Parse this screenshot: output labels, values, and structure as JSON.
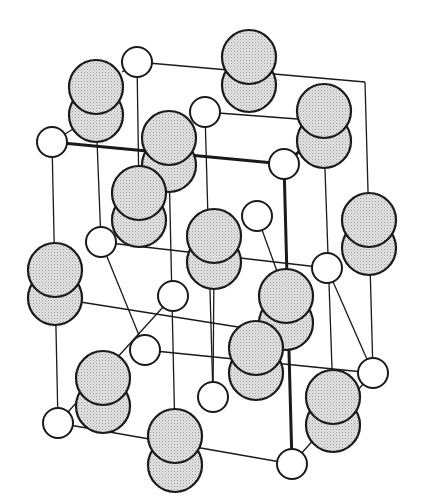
{
  "diagram": {
    "title": "",
    "colors": {
      "background": "#ffffff",
      "stroke": "#1a1a1a",
      "small_atom_fill": "#ffffff",
      "molecule_fill": "#dcdcdc"
    },
    "small_atoms": [
      {
        "x": 137,
        "y": 62
      },
      {
        "x": 52,
        "y": 142
      },
      {
        "x": 205,
        "y": 112
      },
      {
        "x": 284,
        "y": 164
      },
      {
        "x": 257,
        "y": 216
      },
      {
        "x": 101,
        "y": 242
      },
      {
        "x": 327,
        "y": 268
      },
      {
        "x": 173,
        "y": 296
      },
      {
        "x": 145,
        "y": 350
      },
      {
        "x": 58,
        "y": 423
      },
      {
        "x": 213,
        "y": 397
      },
      {
        "x": 292,
        "y": 464
      },
      {
        "x": 373,
        "y": 373
      }
    ],
    "molecules": [
      {
        "x": 96,
        "y1": 87,
        "y2": 115
      },
      {
        "x": 249,
        "y1": 57,
        "y2": 85
      },
      {
        "x": 169,
        "y1": 138,
        "y2": 165
      },
      {
        "x": 324,
        "y1": 111,
        "y2": 141
      },
      {
        "x": 139,
        "y1": 193,
        "y2": 220
      },
      {
        "x": 214,
        "y1": 236,
        "y2": 262
      },
      {
        "x": 369,
        "y1": 220,
        "y2": 248
      },
      {
        "x": 55,
        "y1": 270,
        "y2": 298
      },
      {
        "x": 286,
        "y1": 296,
        "y2": 323
      },
      {
        "x": 103,
        "y1": 378,
        "y2": 406
      },
      {
        "x": 256,
        "y1": 348,
        "y2": 373
      },
      {
        "x": 333,
        "y1": 397,
        "y2": 425
      },
      {
        "x": 175,
        "y1": 436,
        "y2": 465
      }
    ],
    "thin_lines": [
      [
        137,
        62,
        365,
        82
      ],
      [
        137,
        62,
        139,
        193
      ],
      [
        365,
        82,
        373,
        373
      ],
      [
        52,
        142,
        58,
        423
      ],
      [
        58,
        423,
        292,
        464
      ],
      [
        292,
        464,
        373,
        373
      ],
      [
        101,
        242,
        327,
        268
      ],
      [
        101,
        242,
        145,
        350
      ],
      [
        327,
        268,
        373,
        373
      ],
      [
        52,
        142,
        96,
        115
      ],
      [
        137,
        62,
        122,
        72
      ],
      [
        205,
        112,
        324,
        121
      ],
      [
        205,
        112,
        213,
        397
      ],
      [
        96,
        115,
        101,
        242
      ],
      [
        145,
        350,
        373,
        373
      ],
      [
        173,
        296,
        58,
        423
      ],
      [
        55,
        298,
        257,
        330
      ],
      [
        169,
        165,
        175,
        436
      ],
      [
        284,
        164,
        292,
        464
      ],
      [
        257,
        216,
        286,
        296
      ],
      [
        214,
        262,
        213,
        397
      ],
      [
        58,
        423,
        70,
        412
      ],
      [
        139,
        220,
        155,
        210
      ],
      [
        324,
        141,
        333,
        397
      ]
    ],
    "thick_lines": [
      [
        52,
        142,
        284,
        164
      ],
      [
        284,
        164,
        292,
        464
      ],
      [
        284,
        164,
        348,
        112
      ]
    ]
  }
}
